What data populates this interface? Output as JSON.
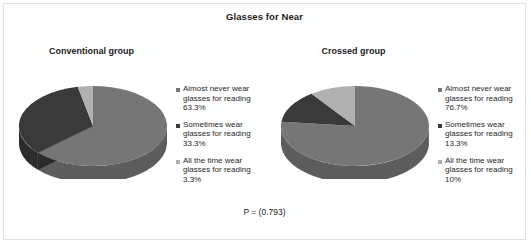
{
  "figure": {
    "title": "Glasses for Near",
    "pvalue": "P = (0.793)",
    "colors": {
      "almost_never": "#767676",
      "sometimes": "#3a3a3a",
      "all_the_time": "#b0b0b0",
      "side_almost_never": "#5d5d5d",
      "side_sometimes": "#2b2b2b",
      "side_all_the_time": "#8c8c8c",
      "frame": "#e2e2e2",
      "background": "#ffffff",
      "text": "#1c1c1c"
    }
  },
  "chart_data": [
    {
      "type": "pie",
      "title": "Conventional group",
      "categories": [
        "Almost never wear glasses for reading 63.3%",
        "Sometimes wear glasses for reading 33.3%",
        "All the time wear glasses for reading 3.3%"
      ],
      "values": [
        63.3,
        33.3,
        3.3
      ],
      "labels": [
        "63.3%",
        "33.3%",
        "3.3%"
      ],
      "legend_position": "right",
      "three_d": true,
      "start_angle": 0,
      "direction": "clockwise"
    },
    {
      "type": "pie",
      "title": "Crossed group",
      "categories": [
        "Almost never wear glasses for reading 76.7%",
        "Sometimes wear glasses for reading 13.3%",
        "All the time wear glasses for reading 10%"
      ],
      "values": [
        76.7,
        13.3,
        10.0
      ],
      "labels": [
        "76.7%",
        "13.3%",
        "10%"
      ],
      "legend_position": "right",
      "three_d": true,
      "start_angle": 0,
      "direction": "clockwise"
    }
  ],
  "panels": [
    {
      "title": "Conventional group",
      "legend": [
        {
          "label": "Almost never wear glasses for reading 63.3%",
          "color": "#767676",
          "icon": "legend-square-icon"
        },
        {
          "label": "Sometimes wear glasses for reading 33.3%",
          "color": "#3a3a3a",
          "icon": "legend-square-icon"
        },
        {
          "label": "All the time wear glasses for reading 3.3%",
          "color": "#b0b0b0",
          "icon": "legend-square-icon"
        }
      ]
    },
    {
      "title": "Crossed group",
      "legend": [
        {
          "label": "Almost never wear glasses for reading 76.7%",
          "color": "#767676",
          "icon": "legend-square-icon"
        },
        {
          "label": "Sometimes wear glasses for reading 13.3%",
          "color": "#3a3a3a",
          "icon": "legend-square-icon"
        },
        {
          "label": "All the time wear glasses for reading 10%",
          "color": "#b0b0b0",
          "icon": "legend-square-icon"
        }
      ]
    }
  ]
}
